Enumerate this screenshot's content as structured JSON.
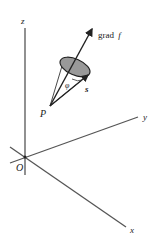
{
  "diagram": {
    "type": "3d-vector-diagram",
    "axes": {
      "x_label": "x",
      "y_label": "y",
      "z_label": "z",
      "origin_label": "O"
    },
    "point_label": "P",
    "gradient_label_prefix": "grad",
    "gradient_label_func": "f",
    "direction_vector_label": "s",
    "angle_label": "φ",
    "colors": {
      "stroke": "#333333",
      "disk_fill": "#999999",
      "background": "#ffffff"
    }
  }
}
